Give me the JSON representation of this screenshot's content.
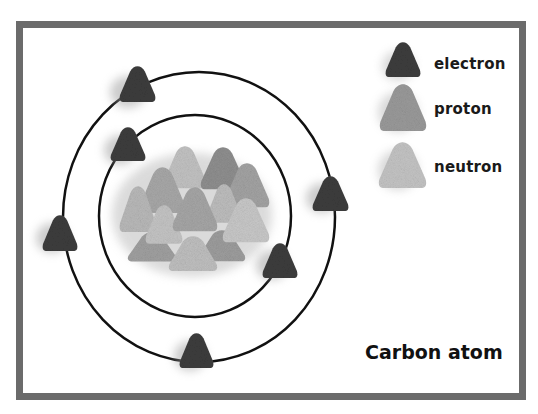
{
  "diagram": {
    "title": "Carbon atom",
    "legend": [
      {
        "key": "electron",
        "label": "electron",
        "color": "#3d3d3d"
      },
      {
        "key": "proton",
        "label": "proton",
        "color": "#9a9a9a"
      },
      {
        "key": "neutron",
        "label": "neutron",
        "color": "#c4c4c4"
      }
    ],
    "orbits": [
      {
        "name": "inner-shell",
        "electrons": 2
      },
      {
        "name": "outer-shell",
        "electrons": 4
      }
    ],
    "nucleus": {
      "protons": 6,
      "neutrons": 6
    },
    "colors": {
      "frame": "#6b6b6b",
      "orbit": "#111111",
      "electron": "#3d3d3d",
      "proton": "#9a9a9a",
      "neutron": "#c4c4c4"
    }
  }
}
